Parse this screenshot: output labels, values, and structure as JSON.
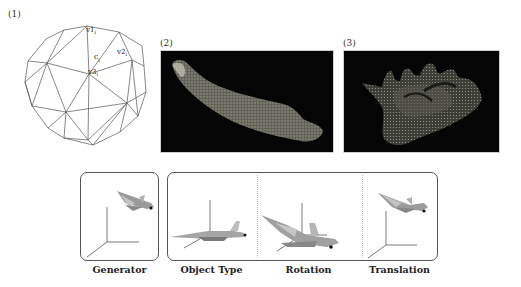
{
  "panels": {
    "sphere": {
      "label": "(1)",
      "vertex_labels": [
        "v1",
        "v2",
        "v3"
      ],
      "subscript": "i",
      "center_label": "c",
      "center_subscript": "i"
    },
    "bone": {
      "label": "(2)"
    },
    "scan": {
      "label": "(3)"
    }
  },
  "transform_diagram": {
    "captions": [
      "Generator",
      "Object Type",
      "Rotation",
      "Translation"
    ]
  },
  "colors": {
    "panel_background": "#050505",
    "mesh_line": "#555555",
    "point_cloud": "#8a8a7a",
    "plane_body": "#a8a8a8",
    "box_border": "#555555"
  }
}
